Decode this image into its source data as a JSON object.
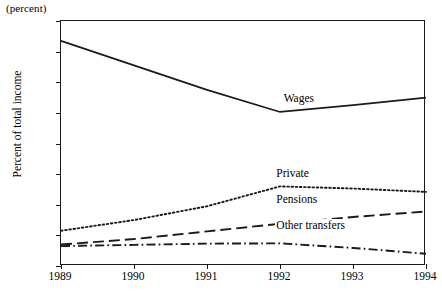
{
  "chart_data": {
    "type": "line",
    "title": "",
    "unit_note": "(percent)",
    "ylabel": "Percent of total income",
    "xlabel": "",
    "ylim": [
      0,
      80
    ],
    "yticks": [
      0,
      10,
      20,
      30,
      40,
      50,
      60,
      70,
      80
    ],
    "xlim": [
      1989,
      1994
    ],
    "x": [
      1989,
      1990,
      1991,
      1992,
      1993,
      1994
    ],
    "xticks": [
      "1989",
      "1990",
      "1991",
      "1992",
      "1993",
      "1994"
    ],
    "grid": false,
    "legend_position": "inline-annotations",
    "series": [
      {
        "name": "Wages",
        "style": "solid",
        "values": [
          73.5,
          65.5,
          57.5,
          50.3,
          52.5,
          55.0
        ],
        "label_x": 1992.05,
        "label_y": 54.0
      },
      {
        "name": "Private",
        "style": "dotted",
        "values": [
          11.5,
          15.0,
          19.5,
          26.0,
          25.3,
          24.2
        ],
        "label_x": 1991.95,
        "label_y": 29.5
      },
      {
        "name": "Pensions",
        "style": "dashed",
        "values": [
          7.0,
          8.8,
          11.3,
          13.8,
          16.0,
          17.8
        ],
        "label_x": 1991.95,
        "label_y": 21.0
      },
      {
        "name": "Other transfers",
        "style": "dashdot",
        "values": [
          6.5,
          6.9,
          7.3,
          7.4,
          5.9,
          4.0
        ],
        "label_x": 1991.95,
        "label_y": 12.4
      }
    ],
    "colors": {
      "axis": "#1a1a1a",
      "line": "#1a1a1a",
      "background": "#ffffff"
    }
  }
}
